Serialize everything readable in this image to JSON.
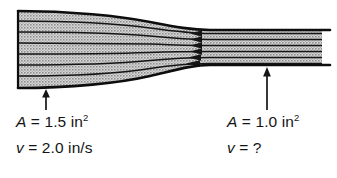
{
  "figure": {
    "type": "fluid-flow-converging-pipe-diagram",
    "background_color": "#ffffff",
    "fill_color": "#b4b4b4",
    "line_color": "#111111",
    "pipe": {
      "inlet": {
        "x": 18,
        "top_y": 11,
        "bottom_y": 88
      },
      "outlet": {
        "x": 322,
        "top_y": 30,
        "bottom_y": 65
      },
      "throat_x": 200,
      "streamline_count": 7,
      "arrowhead_count": 6
    },
    "pointers": [
      {
        "name": "inlet-pointer-arrow",
        "x": 46,
        "tip_y": 90,
        "tail_y": 110
      },
      {
        "name": "outlet-pointer-arrow",
        "x": 267,
        "tip_y": 68,
        "tail_y": 110
      }
    ]
  },
  "labels": {
    "inlet": {
      "area_symbol": "A",
      "area_equals": " = ",
      "area_value": "1.5",
      "area_unit": "in",
      "area_exponent": "2",
      "velocity_symbol": "v",
      "velocity_equals": " = ",
      "velocity_value": "2.0",
      "velocity_unit": "in/s"
    },
    "outlet": {
      "area_symbol": "A",
      "area_equals": " = ",
      "area_value": "1.0",
      "area_unit": "in",
      "area_exponent": "2",
      "velocity_symbol": "v",
      "velocity_equals": " = ",
      "velocity_value": "?",
      "velocity_unit": ""
    }
  }
}
